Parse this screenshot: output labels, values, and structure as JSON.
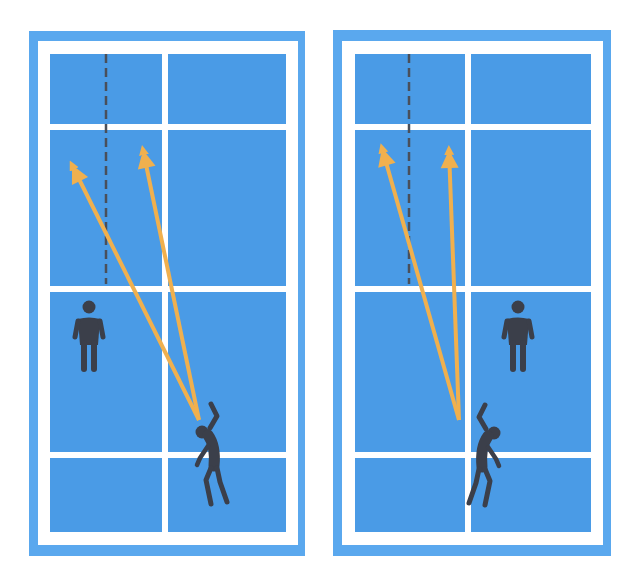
{
  "colors": {
    "background": "#ffffff",
    "court_outer": "#5aa8ee",
    "court_inner": "#4a9be6",
    "lines": "#ffffff",
    "arrow": "#f0b04e",
    "player": "#3b3f4a",
    "dashed_line": "#4a4f5a"
  },
  "courts": [
    {
      "id": "left",
      "outer": {
        "x": 29,
        "y": 31,
        "w": 276,
        "h": 525
      },
      "line_frame": {
        "x": 38,
        "y": 41,
        "w": 260,
        "h": 504
      },
      "inner": {
        "x": 50,
        "y": 54,
        "w": 236,
        "h": 478
      },
      "center_line_x": 165,
      "h_lines_y": [
        127,
        289,
        455
      ],
      "dashed_line": {
        "x": 106,
        "y1": 54,
        "y2": 284
      },
      "arrows": [
        {
          "from": [
            199,
            420
          ],
          "to": [
            72,
            165
          ]
        },
        {
          "from": [
            199,
            420
          ],
          "to": [
            143,
            150
          ]
        }
      ],
      "standing_player": {
        "x": 89,
        "y": 307
      },
      "hitting_player": {
        "x": 202,
        "y": 432,
        "facing": "right"
      }
    },
    {
      "id": "right",
      "outer": {
        "x": 333,
        "y": 30,
        "w": 278,
        "h": 526
      },
      "line_frame": {
        "x": 342,
        "y": 41,
        "w": 261,
        "h": 504
      },
      "inner": {
        "x": 355,
        "y": 54,
        "w": 236,
        "h": 478
      },
      "center_line_x": 468,
      "h_lines_y": [
        127,
        289,
        455
      ],
      "dashed_line": {
        "x": 409,
        "y1": 54,
        "y2": 284
      },
      "arrows": [
        {
          "from": [
            459,
            420
          ],
          "to": [
            382,
            148
          ]
        },
        {
          "from": [
            459,
            420
          ],
          "to": [
            449,
            150
          ]
        }
      ],
      "standing_player": {
        "x": 518,
        "y": 307
      },
      "hitting_player": {
        "x": 494,
        "y": 433,
        "facing": "left"
      }
    }
  ]
}
